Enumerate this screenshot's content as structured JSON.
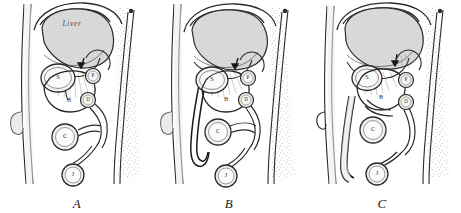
{
  "figure": {
    "panel_count": 3,
    "background_color": "#ffffff",
    "ink_color": "#1a1a1a",
    "liver_fill_color": "#d8d8d8",
    "stipple_color": "#555555"
  },
  "panels": [
    {
      "id": "A",
      "caption": "A",
      "liver_label": "Liver",
      "organ_labels": [
        {
          "key": "S",
          "text": "S",
          "name": "stomach"
        },
        {
          "key": "B",
          "text": "B",
          "name": "bile-region"
        },
        {
          "key": "P",
          "text": "P",
          "name": "pylorus"
        },
        {
          "key": "D",
          "text": "D",
          "name": "duodenum"
        },
        {
          "key": "C",
          "text": "C",
          "name": "colon"
        },
        {
          "key": "J",
          "text": "J",
          "name": "jejunum"
        }
      ]
    },
    {
      "id": "B",
      "caption": "B",
      "liver_label": "",
      "organ_labels": [
        {
          "key": "S",
          "text": "S",
          "name": "stomach"
        },
        {
          "key": "B",
          "text": "B",
          "name": "bile-region"
        },
        {
          "key": "P",
          "text": "P",
          "name": "pylorus"
        },
        {
          "key": "D",
          "text": "D",
          "name": "duodenum"
        },
        {
          "key": "C",
          "text": "C",
          "name": "colon"
        },
        {
          "key": "J",
          "text": "J",
          "name": "jejunum"
        }
      ]
    },
    {
      "id": "C",
      "caption": "C",
      "liver_label": "",
      "organ_labels": [
        {
          "key": "S",
          "text": "S",
          "name": "stomach"
        },
        {
          "key": "B",
          "text": "B",
          "name": "bile-region"
        },
        {
          "key": "P",
          "text": "P",
          "name": "pylorus"
        },
        {
          "key": "D",
          "text": "D",
          "name": "duodenum"
        },
        {
          "key": "C",
          "text": "C",
          "name": "colon"
        },
        {
          "key": "J",
          "text": "J",
          "name": "jejunum"
        }
      ]
    }
  ]
}
